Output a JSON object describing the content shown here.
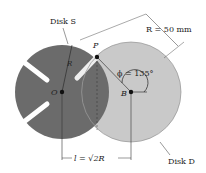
{
  "diagram": {
    "labels": {
      "disk_s": "Disk S",
      "disk_d": "Disk D",
      "radius_dim": "R = 50 mm",
      "angle": "ϕ = 135°",
      "point_p": "P",
      "point_o": "O",
      "point_b": "B",
      "radius_r": "R",
      "distance": "l = √2R"
    },
    "values": {
      "R_mm": 50,
      "phi_deg": 135,
      "l_expr": "√2R"
    },
    "colors": {
      "disk_s": "#6b6b6b",
      "disk_d": "#c9c9c9",
      "lines": "#333333",
      "background": "#ffffff"
    }
  }
}
